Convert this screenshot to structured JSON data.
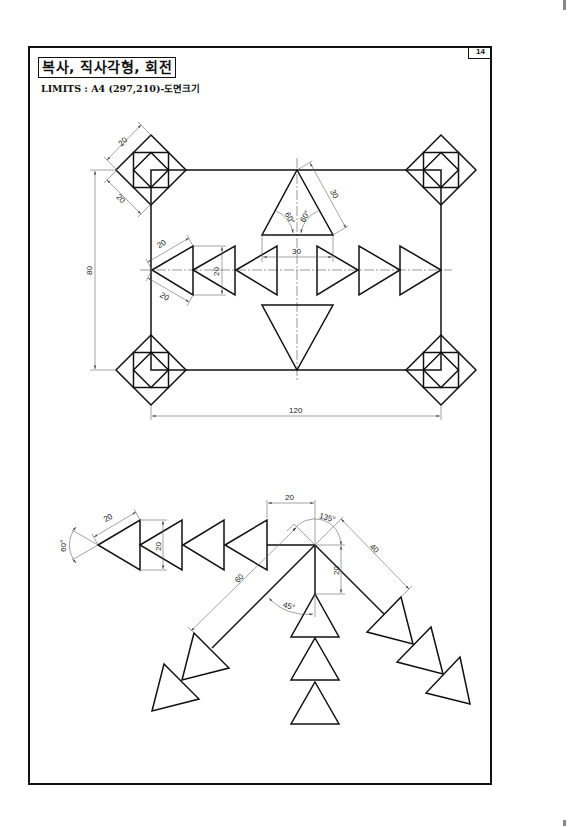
{
  "header": {
    "title": "복사, 직사각형, 회전",
    "limits": "LIMITS : A4 (297,210)-도면크기",
    "page_number": "14"
  },
  "drawing_top": {
    "dimensions": {
      "square_side_a": "20",
      "square_side_b": "20",
      "height": "80",
      "width": "120",
      "tri_side_a": "20",
      "tri_side_b": "20",
      "tri_height": "20",
      "top_tri_side": "30",
      "top_tri_base": "30",
      "angle_left": "60°",
      "angle_right": "60°"
    }
  },
  "drawing_bottom": {
    "dimensions": {
      "tri_side": "20",
      "tri_height": "20",
      "tip_angle": "60°",
      "offset": "20",
      "arc_angle": "135°",
      "vertical": "20",
      "right_arm": "40",
      "left_arm": "60",
      "angle_45": "45°"
    }
  },
  "colors": {
    "ink": "#111111",
    "dim_line": "#666666",
    "background": "#ffffff"
  }
}
